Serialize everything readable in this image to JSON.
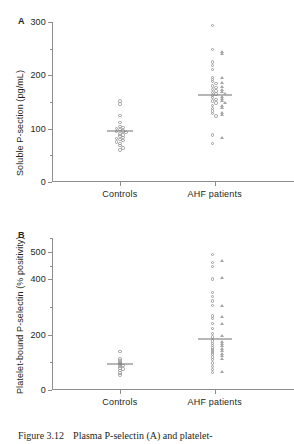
{
  "figure": {
    "caption_number": "Figure 3.12",
    "caption_text": "Plasma P-selectin (A) and platelet-"
  },
  "panels": [
    {
      "letter": "A",
      "ylabel": "Soluble P-section (pg/mL)",
      "ytick_labels": [
        "300",
        "200",
        "100",
        "0"
      ],
      "xtick_labels": [
        "Controls",
        "AHF patients"
      ]
    },
    {
      "letter": "B",
      "ylabel": "Platelet-bound P-selectin (% positivity)",
      "ytick_labels": [
        "500",
        "400",
        "200",
        "0"
      ],
      "xtick_labels": [
        "Controls",
        "AHF patients"
      ]
    }
  ],
  "colors": {
    "axis": "#8d8d8d",
    "marker": "#9b9b9b",
    "triangle": "#a5a5a5",
    "mean_line": "#6f6f6f",
    "text": "#231f20"
  },
  "chart_data": [
    {
      "type": "scatter",
      "panel": "A",
      "title": "",
      "xlabel": "",
      "ylabel": "Soluble P-section (pg/mL)",
      "ylim": [
        0,
        300
      ],
      "yticks_major": [
        0,
        100,
        200,
        300
      ],
      "yticks_minor": [
        50,
        150,
        250
      ],
      "grid": false,
      "legend": "none",
      "categories": [
        "Controls",
        "AHF patients"
      ],
      "series": [
        {
          "name": "Controls",
          "marker": "circle",
          "x_category": "Controls",
          "mean": 96,
          "values": [
            152,
            146,
            125,
            112,
            104,
            102,
            100,
            98,
            96,
            95,
            93,
            90,
            88,
            86,
            84,
            82,
            80,
            78,
            75,
            72,
            68,
            64,
            60
          ]
        },
        {
          "name": "AHF patients circles",
          "marker": "circle",
          "x_category": "AHF patients",
          "mean": 164,
          "values": [
            294,
            248,
            225,
            218,
            211,
            196,
            192,
            188,
            185,
            180,
            177,
            174,
            171,
            168,
            165,
            162,
            158,
            155,
            152,
            148,
            143,
            138,
            133,
            128,
            124,
            88,
            72
          ]
        },
        {
          "name": "AHF patients triangles",
          "marker": "triangle",
          "x_category": "AHF patients",
          "mean": 164,
          "values": [
            243,
            240,
            195,
            186,
            178,
            172,
            168,
            165,
            160,
            156,
            152,
            148,
            143,
            138,
            130,
            126,
            82
          ]
        }
      ]
    },
    {
      "type": "scatter",
      "panel": "B",
      "title": "",
      "xlabel": "",
      "ylabel": "Platelet-bound P-selectin (% positivity)",
      "ylim": [
        0,
        550
      ],
      "yticks_major": [
        0,
        200,
        400,
        500
      ],
      "yticks_minor": [
        100,
        300,
        450,
        550
      ],
      "grid": false,
      "legend": "none",
      "categories": [
        "Controls",
        "AHF patients"
      ],
      "series": [
        {
          "name": "Controls",
          "marker": "circle",
          "x_category": "Controls",
          "mean": 95,
          "values": [
            140,
            112,
            105,
            100,
            96,
            92,
            88,
            84,
            80,
            76,
            70,
            62,
            55
          ]
        },
        {
          "name": "AHF patients circles",
          "marker": "circle",
          "x_category": "AHF patients",
          "mean": 185,
          "values": [
            490,
            462,
            448,
            402,
            352,
            338,
            322,
            305,
            268,
            258,
            240,
            222,
            205,
            192,
            178,
            168,
            160,
            152,
            145,
            138,
            130,
            120,
            110,
            98,
            86,
            74,
            64
          ]
        },
        {
          "name": "AHF patients triangles",
          "marker": "triangle",
          "x_category": "AHF patients",
          "mean": 185,
          "values": [
            468,
            405,
            305,
            265,
            238,
            195,
            175,
            168,
            158,
            150,
            142,
            132,
            122,
            112,
            64
          ]
        }
      ]
    }
  ]
}
